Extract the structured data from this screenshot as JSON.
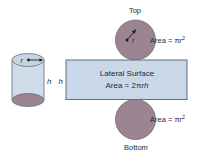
{
  "diagram": {
    "cylinder": {
      "radius_label": "r",
      "height_label": "h"
    },
    "net": {
      "side_height_label": "h",
      "top": {
        "label": "Top",
        "radius_label": "r",
        "area_prefix": "Area = π",
        "area_var": "r",
        "area_exp": "2"
      },
      "lateral": {
        "line1": "Lateral Surface",
        "area_prefix": "Area = 2π",
        "area_var": "rh"
      },
      "bottom": {
        "label": "Bottom",
        "area_prefix": "Area = π",
        "area_var": "r",
        "area_exp": "2"
      }
    },
    "colors": {
      "cylinder_fill": "#cfdcea",
      "base_fill": "#9b8593",
      "top_ellipse_fill": "#c6d4e6",
      "rect_fill": "#c9d8e8",
      "stroke": "#6b6b78",
      "text": "#2a2a2a"
    }
  }
}
